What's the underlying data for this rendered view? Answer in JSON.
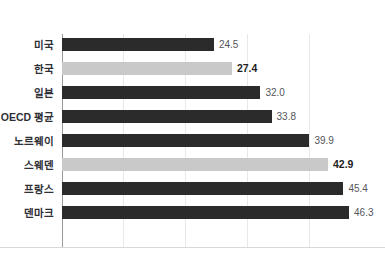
{
  "chart_data": {
    "type": "bar",
    "orientation": "horizontal",
    "title": "",
    "xlabel": "",
    "ylabel": "",
    "xlim": [
      0,
      50
    ],
    "grid": true,
    "gridline_values": [
      0,
      10,
      20,
      30,
      40
    ],
    "legend": "none",
    "categories": [
      "미국",
      "한국",
      "일본",
      "OECD 평균",
      "노르웨이",
      "스웨덴",
      "프랑스",
      "덴마크"
    ],
    "values": [
      24.5,
      27.4,
      32.0,
      33.8,
      39.9,
      42.9,
      45.4,
      46.3
    ],
    "value_labels": [
      "24.5",
      "27.4",
      "32.0",
      "33.8",
      "39.9",
      "42.9",
      "45.4",
      "46.3"
    ],
    "highlighted": [
      false,
      true,
      false,
      false,
      false,
      true,
      false,
      false
    ],
    "colors": {
      "bar_default": "#2b2b2b",
      "bar_highlight": "#c9c9c9",
      "gridline": "#e8e8e8",
      "axis": "#9a9a9a",
      "label_text": "#2f2f36",
      "value_text": "#55555c",
      "value_text_highlight": "#1d1d22",
      "background": "#ffffff"
    }
  }
}
